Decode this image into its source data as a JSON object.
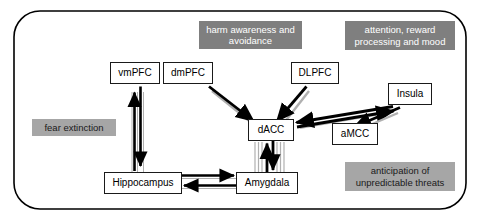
{
  "figure": {
    "title": "",
    "frame": {
      "border_color": "#000000",
      "background": "#ffffff"
    }
  },
  "colors": {
    "node_border": "#1a1a1a",
    "node_fill": "#ffffff",
    "arrow_black": "#000000",
    "arrow_shadow_gray": "#b0b0b0",
    "label_dark_gray": "#7f7f7f",
    "label_light_gray": "#a6a6a6",
    "label_dark_text": "#ffffff",
    "label_light_text": "#1a1a1a"
  },
  "nodes": [
    {
      "id": "vmpfc",
      "label": "vmPFC"
    },
    {
      "id": "dmpfc",
      "label": "dmPFC"
    },
    {
      "id": "dlpfc",
      "label": "DLPFC"
    },
    {
      "id": "insula",
      "label": "Insula"
    },
    {
      "id": "dacc",
      "label": "dACC"
    },
    {
      "id": "amcc",
      "label": "aMCC"
    },
    {
      "id": "hippocampus",
      "label": "Hippocampus"
    },
    {
      "id": "amygdala",
      "label": "Amygdala"
    }
  ],
  "function_labels": [
    {
      "id": "harm",
      "text": "harm awareness and avoidance",
      "style": "dark"
    },
    {
      "id": "attention",
      "text": "attention, reward processing and mood",
      "style": "dark"
    },
    {
      "id": "fear",
      "text": "fear extinction",
      "style": "light"
    },
    {
      "id": "anticipation",
      "text": "anticipation of unpredictable threats",
      "style": "light"
    }
  ],
  "connections": [
    {
      "from": "vmpfc",
      "to": "hippocampus",
      "direction": "bidirectional"
    },
    {
      "from": "dmpfc",
      "to": "dacc",
      "direction": "unidirectional"
    },
    {
      "from": "dlpfc",
      "to": "dacc",
      "direction": "unidirectional"
    },
    {
      "from": "insula",
      "to": "dacc",
      "direction": "bidirectional"
    },
    {
      "from": "insula",
      "to": "amcc",
      "direction": "unidirectional"
    },
    {
      "from": "dacc",
      "to": "amygdala",
      "direction": "bidirectional"
    },
    {
      "from": "hippocampus",
      "to": "amygdala",
      "direction": "bidirectional"
    }
  ]
}
